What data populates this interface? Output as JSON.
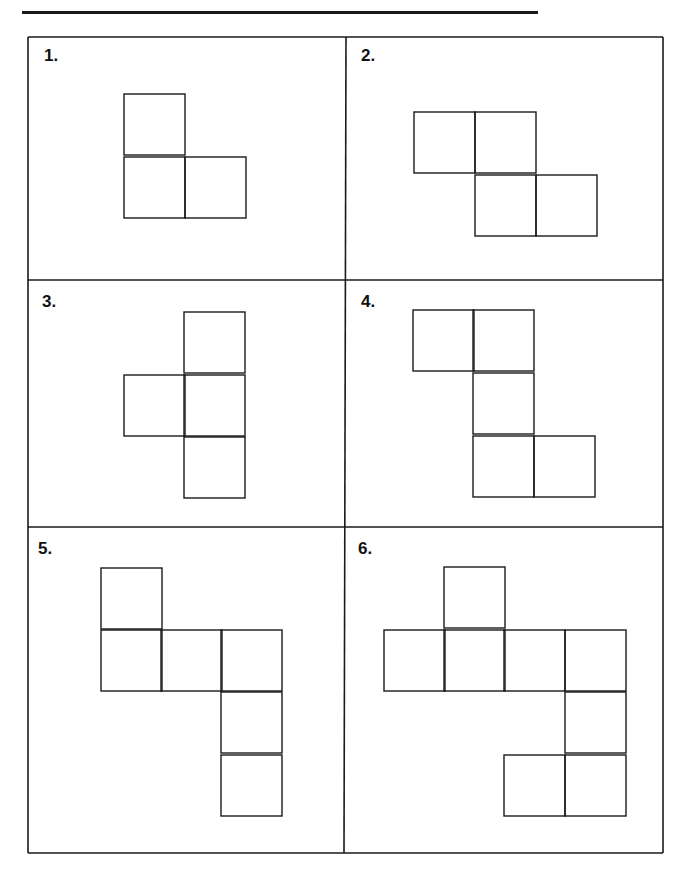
{
  "page": {
    "name_line": ""
  },
  "worksheet": {
    "line_color": "#1a1a1a",
    "square_size": 61,
    "panels": [
      {
        "label": "1.",
        "label_pos": [
          44,
          46
        ],
        "squares": [
          [
            124,
            94
          ],
          [
            124,
            157
          ],
          [
            185,
            157
          ]
        ]
      },
      {
        "label": "2.",
        "label_pos": [
          361,
          46
        ],
        "squares": [
          [
            414,
            112
          ],
          [
            475,
            112
          ],
          [
            475,
            175
          ],
          [
            536,
            175
          ]
        ]
      },
      {
        "label": "3.",
        "label_pos": [
          42,
          292
        ],
        "squares": [
          [
            184,
            312
          ],
          [
            124,
            375
          ],
          [
            184,
            375
          ],
          [
            184,
            437
          ]
        ]
      },
      {
        "label": "4.",
        "label_pos": [
          361,
          292
        ],
        "squares": [
          [
            413,
            310
          ],
          [
            473,
            310
          ],
          [
            473,
            373
          ],
          [
            473,
            436
          ],
          [
            534,
            436
          ]
        ]
      },
      {
        "label": "5.",
        "label_pos": [
          38,
          539
        ],
        "squares": [
          [
            101,
            568
          ],
          [
            101,
            630
          ],
          [
            161,
            630
          ],
          [
            221,
            630
          ],
          [
            221,
            692
          ],
          [
            221,
            755
          ]
        ]
      },
      {
        "label": "6.",
        "label_pos": [
          358,
          539
        ],
        "squares": [
          [
            444,
            567
          ],
          [
            384,
            630
          ],
          [
            444,
            630
          ],
          [
            504,
            630
          ],
          [
            565,
            630
          ],
          [
            565,
            692
          ],
          [
            504,
            755
          ],
          [
            565,
            755
          ]
        ]
      }
    ],
    "grid": {
      "outer": {
        "left": 28,
        "top": 37,
        "right": 663,
        "bottom": 853
      },
      "vertical_divider": {
        "top_x": 346,
        "bottom_x": 344
      },
      "horizontal_dividers": [
        280,
        527
      ]
    }
  }
}
